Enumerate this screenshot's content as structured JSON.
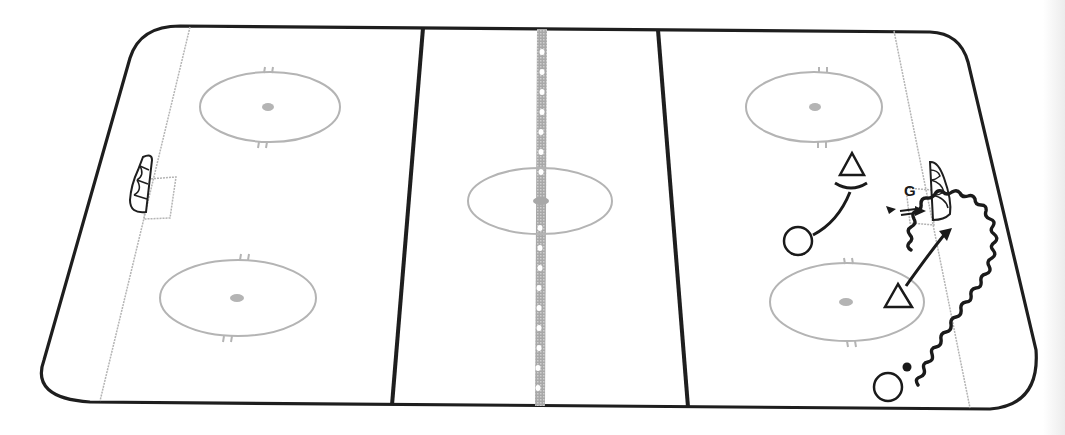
{
  "diagram": {
    "type": "ice-rink-drill",
    "colors": {
      "boards": "#1e1e1e",
      "lines_faint": "#b4b4b4",
      "red_line": "#9a9a9a",
      "blue_lines": "#1e1e1e",
      "ink": "#1a1a1a"
    },
    "rink": {
      "zones": [
        "left-zone",
        "neutral-zone",
        "right-zone"
      ],
      "faceoff_circles": [
        {
          "id": "left-top",
          "cx": 270,
          "cy": 107
        },
        {
          "id": "left-bottom",
          "cx": 238,
          "cy": 298
        },
        {
          "id": "center",
          "cx": 540,
          "cy": 201
        },
        {
          "id": "right-top",
          "cx": 814,
          "cy": 107
        },
        {
          "id": "right-bottom",
          "cx": 847,
          "cy": 302
        }
      ]
    },
    "labels": {
      "goalie": "G"
    },
    "players": [
      {
        "kind": "offense",
        "symbol": "circle",
        "x": 798,
        "y": 241
      },
      {
        "kind": "offense",
        "symbol": "circle",
        "x": 888,
        "y": 387
      },
      {
        "kind": "defense",
        "symbol": "triangle",
        "x": 852,
        "y": 166
      },
      {
        "kind": "defense",
        "symbol": "triangle",
        "x": 898,
        "y": 296
      }
    ],
    "puck": {
      "x": 907,
      "y": 367
    },
    "icons": [
      "goal-net-left",
      "goal-net-right",
      "skate-wavy-path",
      "pass-arrow",
      "skating-arrow",
      "shot-arrow"
    ]
  }
}
